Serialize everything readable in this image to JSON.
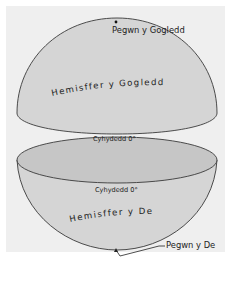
{
  "diagram": {
    "type": "hemispheres",
    "colors": {
      "panel": "#efefef",
      "page": "#ffffff",
      "hemisphere_fill": "#d5d5d5",
      "equator_plane": "#c6c6c6",
      "outline": "#3a3a3a",
      "text": "#222222"
    },
    "labels": {
      "north_pole": "Pegwn y Gogledd",
      "northern_hemisphere": "Hemisffer y Gogledd",
      "equator_upper": "Cyhydedd 0°",
      "equator_lower": "Cyhydedd 0°",
      "southern_hemisphere": "Hemisffer y De",
      "south_pole": "Pegwn y De"
    }
  }
}
